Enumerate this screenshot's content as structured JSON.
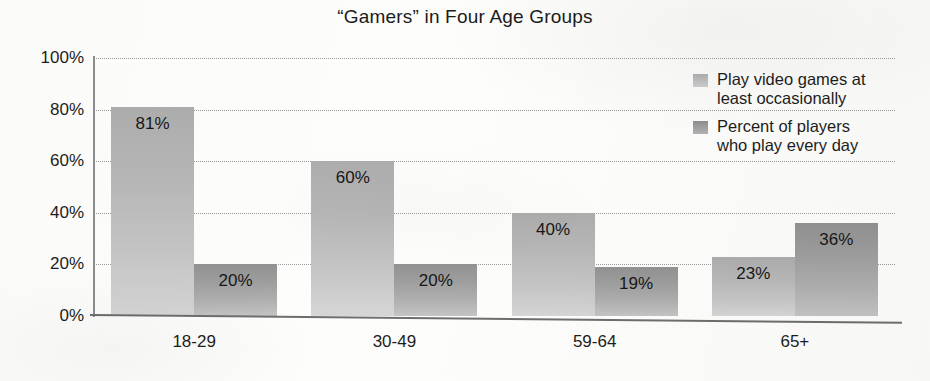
{
  "chart_data": {
    "type": "bar",
    "title": "“Gamers” in Four Age Groups",
    "xlabel": "",
    "ylabel": "",
    "ylim": [
      0,
      100
    ],
    "ytick_labels": [
      "0%",
      "20%",
      "40%",
      "60%",
      "80%",
      "100%"
    ],
    "ytick_values": [
      0,
      20,
      40,
      60,
      80,
      100
    ],
    "grid": true,
    "grid_style": "dotted",
    "legend_position": "top-right",
    "categories": [
      "18-29",
      "30-49",
      "59-64",
      "65+"
    ],
    "series": [
      {
        "name": "Play video games at least occasionally",
        "values": [
          81,
          60,
          40,
          23
        ],
        "value_labels": [
          "81%",
          "60%",
          "40%",
          "23%"
        ],
        "color": "#b7b7b7"
      },
      {
        "name": "Percent of players who play every day",
        "values": [
          20,
          20,
          19,
          36
        ],
        "value_labels": [
          "20%",
          "20%",
          "19%",
          "36%"
        ],
        "color": "#9d9d9d"
      }
    ]
  },
  "legend": {
    "entries": [
      {
        "label_line1": "Play video games at",
        "label_line2": "least occasionally"
      },
      {
        "label_line1": "Percent of players",
        "label_line2": "who play every day"
      }
    ]
  }
}
